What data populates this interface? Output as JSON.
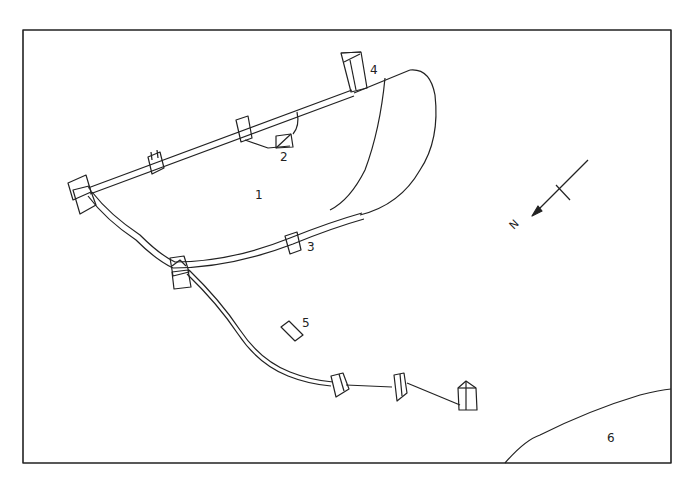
{
  "diagram": {
    "type": "site-plan",
    "labels": [
      {
        "id": "1",
        "text": "1"
      },
      {
        "id": "2",
        "text": "2"
      },
      {
        "id": "3",
        "text": "3"
      },
      {
        "id": "4",
        "text": "4"
      },
      {
        "id": "5",
        "text": "5"
      },
      {
        "id": "6",
        "text": "6"
      }
    ],
    "north_arrow": {
      "label": "N",
      "icon": "north-arrow-icon"
    },
    "colors": {
      "line": "#222222",
      "background": "#ffffff"
    }
  }
}
